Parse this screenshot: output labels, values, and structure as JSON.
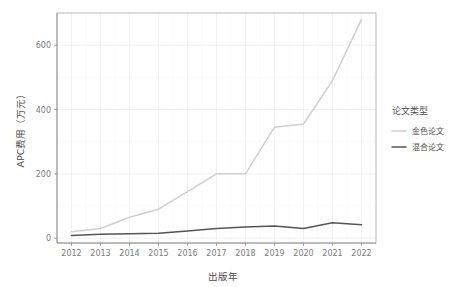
{
  "chart_data": {
    "type": "line",
    "title": "",
    "xlabel": "出版年",
    "ylabel": "APC费用（万元）",
    "x": [
      2012,
      2013,
      2014,
      2015,
      2016,
      2017,
      2018,
      2019,
      2020,
      2021,
      2022
    ],
    "xticklabels": [
      "2012",
      "2013",
      "2014",
      "2015",
      "2016",
      "2017",
      "2018",
      "2019",
      "2020",
      "2021",
      "2022"
    ],
    "yticklabels": [
      "0",
      "200",
      "400",
      "600"
    ],
    "yticks": [
      0,
      200,
      400,
      600
    ],
    "xlim": [
      2011.5,
      2022.5
    ],
    "ylim": [
      -15,
      700
    ],
    "grid": true,
    "legend_position": "right",
    "series": [
      {
        "name": "金色论文",
        "color": "#cfcfcf",
        "values": [
          20,
          30,
          65,
          90,
          145,
          200,
          200,
          345,
          355,
          490,
          680
        ]
      },
      {
        "name": "混合论文",
        "color": "#565656",
        "values": [
          8,
          12,
          14,
          15,
          22,
          30,
          35,
          38,
          30,
          48,
          42
        ]
      }
    ]
  },
  "legend": {
    "title": "论文类型",
    "items": [
      {
        "label": "金色论文",
        "color": "#cfcfcf"
      },
      {
        "label": "混合论文",
        "color": "#565656"
      }
    ]
  },
  "axes": {
    "x_title": "出版年",
    "y_title": "APC费用（万元）"
  }
}
